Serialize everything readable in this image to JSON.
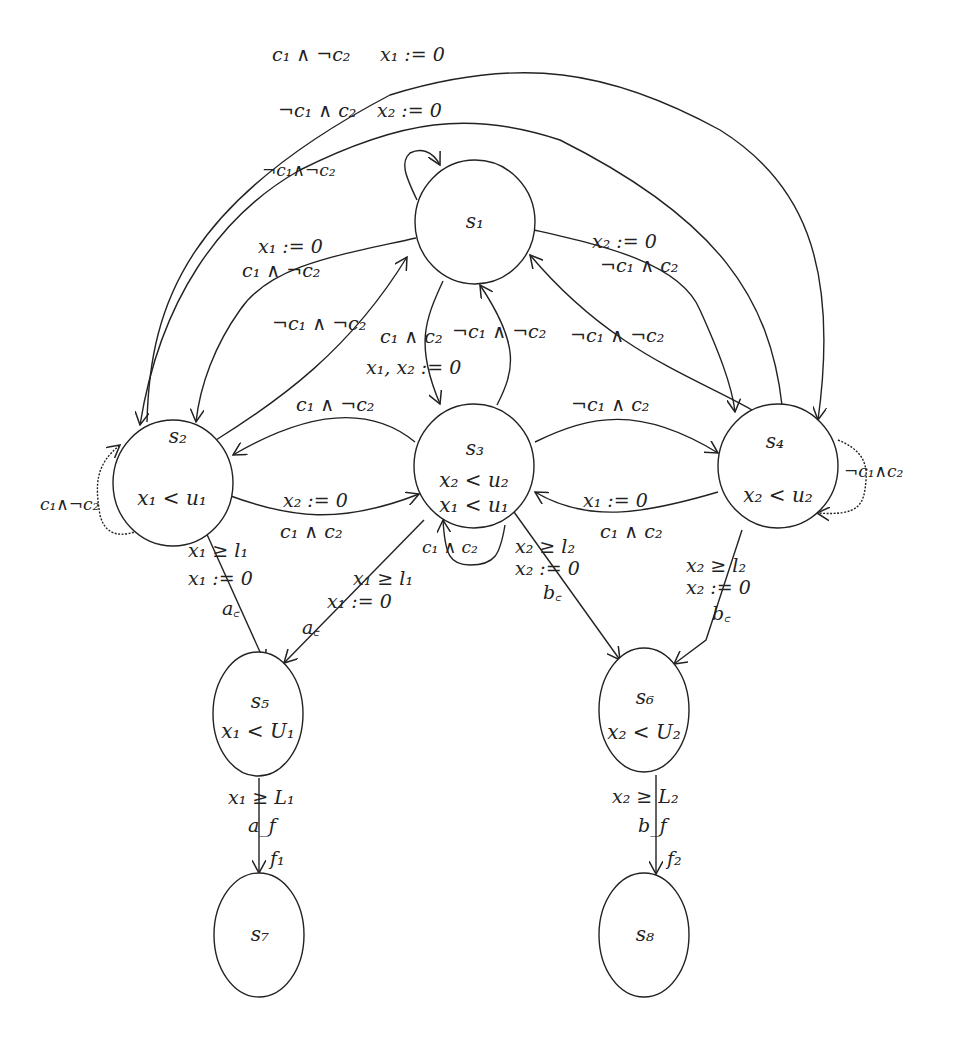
{
  "diagram": {
    "type": "timed-automaton",
    "nodes": [
      {
        "id": "s1",
        "name": "s",
        "sub": "1",
        "invariants": [],
        "cx": 475,
        "cy": 222,
        "rx": 60,
        "ry": 62
      },
      {
        "id": "s2",
        "name": "s",
        "sub": "2",
        "invariants": [
          {
            "text": "x₁ < u₁"
          }
        ],
        "cx": 173,
        "cy": 483,
        "rx": 60,
        "ry": 63
      },
      {
        "id": "s3",
        "name": "s",
        "sub": "3",
        "invariants": [
          {
            "text": "x₂ < u₂"
          },
          {
            "text": "x₁ < u₁"
          }
        ],
        "cx": 474,
        "cy": 466,
        "rx": 60,
        "ry": 62
      },
      {
        "id": "s4",
        "name": "s",
        "sub": "4",
        "invariants": [
          {
            "text": "x₂ < u₂"
          }
        ],
        "cx": 778,
        "cy": 466,
        "rx": 60,
        "ry": 62
      },
      {
        "id": "s5",
        "name": "s",
        "sub": "5",
        "invariants": [
          {
            "text": "x₁ < U₁"
          }
        ],
        "cx": 258,
        "cy": 714,
        "rx": 45,
        "ry": 62
      },
      {
        "id": "s6",
        "name": "s",
        "sub": "6",
        "invariants": [
          {
            "text": "x₂ < U₂"
          }
        ],
        "cx": 644,
        "cy": 710,
        "rx": 45,
        "ry": 62
      },
      {
        "id": "s7",
        "name": "s",
        "sub": "7",
        "invariants": [],
        "cx": 259,
        "cy": 935,
        "rx": 45,
        "ry": 62
      },
      {
        "id": "s8",
        "name": "s",
        "sub": "8",
        "invariants": [],
        "cx": 644,
        "cy": 935,
        "rx": 45,
        "ry": 62
      }
    ],
    "edges": [
      {
        "from": "s2",
        "to": "s4",
        "guard": "c₁ ∧ ¬c₂",
        "reset": "x₁ := 0"
      },
      {
        "from": "s4",
        "to": "s2",
        "guard": "¬c₁ ∧ c₂",
        "reset": "x₂ := 0"
      },
      {
        "from": "s1",
        "to": "s1",
        "guard": "¬c₁∧¬c₂"
      },
      {
        "from": "s1",
        "to": "s2",
        "guard": "c₁ ∧ ¬c₂",
        "reset": "x₁ := 0"
      },
      {
        "from": "s1",
        "to": "s4",
        "guard": "¬c₁ ∧ c₂",
        "reset": "x₂ := 0"
      },
      {
        "from": "s2",
        "to": "s1",
        "guard": "¬c₁ ∧ ¬c₂"
      },
      {
        "from": "s1",
        "to": "s3",
        "guard": "c₁ ∧ c₂",
        "reset": "x₁, x₂ := 0"
      },
      {
        "from": "s3",
        "to": "s1",
        "guard": "¬c₁ ∧ ¬c₂"
      },
      {
        "from": "s4",
        "to": "s1",
        "guard": "¬c₁ ∧ ¬c₂"
      },
      {
        "from": "s3",
        "to": "s2",
        "guard": "c₁ ∧ ¬c₂"
      },
      {
        "from": "s3",
        "to": "s4",
        "guard": "¬c₁ ∧ c₂"
      },
      {
        "from": "s2",
        "to": "s3",
        "guard": "c₁ ∧ c₂",
        "reset": "x₂ := 0"
      },
      {
        "from": "s4",
        "to": "s3",
        "guard": "c₁ ∧ c₂",
        "reset": "x₁ := 0"
      },
      {
        "from": "s2",
        "to": "s2",
        "guard": "c₁∧¬c₂"
      },
      {
        "from": "s3",
        "to": "s3",
        "guard": "c₁ ∧ c₂"
      },
      {
        "from": "s4",
        "to": "s4",
        "guard": "¬c₁∧c₂"
      },
      {
        "from": "s2",
        "to": "s5",
        "guard": "x₁ ≥ l₁",
        "reset": "x₁ := 0",
        "action": "a_c"
      },
      {
        "from": "s3",
        "to": "s5",
        "guard": "x₁ ≥ l₁",
        "reset": "x₁ := 0",
        "action": "a_c"
      },
      {
        "from": "s3",
        "to": "s6",
        "guard": "x₂ ≥ l₂",
        "reset": "x₂ := 0",
        "action": "b_c"
      },
      {
        "from": "s4",
        "to": "s6",
        "guard": "x₂ ≥ l₂",
        "reset": "x₂ := 0",
        "action": "b_c"
      },
      {
        "from": "s5",
        "to": "s7",
        "guard": "x₁ ≥ L₁",
        "action": "a_f",
        "label": "f₁"
      },
      {
        "from": "s6",
        "to": "s8",
        "guard": "x₂ ≥ L₂",
        "action": "b_f",
        "label": "f₂"
      }
    ]
  },
  "labels": {
    "top_outer_guard": "c₁ ∧ ¬c₂",
    "top_outer_reset": "x₁ := 0",
    "top_inner_guard": "¬c₁ ∧ c₂",
    "top_inner_reset": "x₂ := 0",
    "s1_self": "¬c₁∧¬c₂",
    "s1_s2_reset": "x₁ := 0",
    "s1_s2_guard": "c₁ ∧ ¬c₂",
    "s1_s4_reset": "x₂ := 0",
    "s1_s4_guard": "¬c₁ ∧ c₂",
    "s2_s1_guard": "¬c₁ ∧ ¬c₂",
    "s1_s3_guard": "c₁ ∧ c₂",
    "s1_s3_reset": "x₁, x₂ := 0",
    "s3_s1_guard": "¬c₁ ∧ ¬c₂",
    "s4_s1_guard": "¬c₁ ∧ ¬c₂",
    "s3_s2_guard": "c₁ ∧ ¬c₂",
    "s3_s4_guard": "¬c₁ ∧ c₂",
    "s2_s3_reset": "x₂ := 0",
    "s2_s3_guard": "c₁ ∧ c₂",
    "s4_s3_reset": "x₁ := 0",
    "s4_s3_guard": "c₁ ∧ c₂",
    "s2_self": "c₁∧¬c₂",
    "s3_self": "c₁ ∧ c₂",
    "s4_self": "¬c₁∧c₂",
    "s2_s5_guard": "x₁ ≥ l₁",
    "s2_s5_reset": "x₁ := 0",
    "s2_s5_action": "a꜀",
    "s3_s5_guard": "x₁ ≥ l₁",
    "s3_s5_reset": "x₁ := 0",
    "s3_s5_action": "a꜀",
    "s3_s6_guard": "x₂ ≥ l₂",
    "s3_s6_reset": "x₂ := 0",
    "s3_s6_action": "b꜀",
    "s4_s6_guard": "x₂ ≥ l₂",
    "s4_s6_reset": "x₂ := 0",
    "s4_s6_action": "b꜀",
    "s5_s7_guard": "x₁ ≥ L₁",
    "s5_s7_action": "a_f",
    "s5_s7_label": "f₁",
    "s6_s8_guard": "x₂ ≥ L₂",
    "s6_s8_action": "b_f",
    "s6_s8_label": "f₂",
    "s1": "s₁",
    "s2": "s₂",
    "s3": "s₃",
    "s4": "s₄",
    "s5": "s₅",
    "s6": "s₆",
    "s7": "s₇",
    "s8": "s₈",
    "s2_inv": "x₁ < u₁",
    "s3_inv1": "x₂ < u₂",
    "s3_inv2": "x₁ < u₁",
    "s4_inv": "x₂ < u₂",
    "s5_inv": "x₁ < U₁",
    "s6_inv": "x₂ < U₂"
  }
}
